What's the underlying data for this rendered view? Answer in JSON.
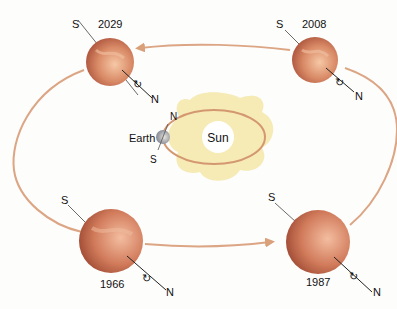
{
  "diagram": {
    "planets": [
      {
        "year": "2029",
        "pole_top": "S",
        "pole_bottom": "N"
      },
      {
        "year": "2008",
        "pole_top": "S",
        "pole_bottom": "N"
      },
      {
        "year": "1966",
        "pole_top": "S",
        "pole_bottom": "N"
      },
      {
        "year": "1987",
        "pole_top": "S",
        "pole_bottom": "N"
      }
    ],
    "sun_label": "Sun",
    "earth": {
      "label": "Earth",
      "pole_top": "N",
      "pole_bottom": "S"
    },
    "colors": {
      "orbit": "#d9a07a",
      "planet_light": "#f2b48c",
      "planet_dark": "#b4553a",
      "sun_glow": "#f7ecb0",
      "earth": "#9aa0a8"
    }
  }
}
